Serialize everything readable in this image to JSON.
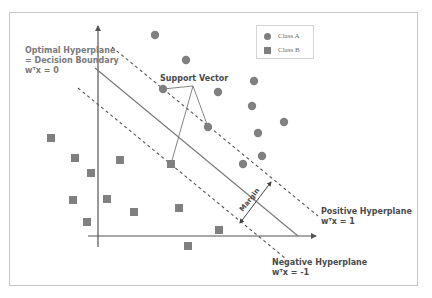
{
  "labels": {
    "optimal_hyperplane_line1": "Optimal Hyperplane",
    "optimal_hyperplane_line2": "= Decision Boundary",
    "optimal_hyperplane_eq": "wᵀx = 0",
    "support_vector": "Support Vector",
    "margin": "Margin",
    "positive_hyperplane": "Positive Hyperplane",
    "positive_hyperplane_eq": "wᵀx = 1",
    "negative_hyperplane": "Negative Hyperplane",
    "negative_hyperplane_eq": "wᵀx = -1"
  },
  "legend": {
    "items": [
      {
        "label": "Class A",
        "shape": "circle"
      },
      {
        "label": "Class B",
        "shape": "square"
      }
    ]
  },
  "colors": {
    "point_fill": "#808080",
    "axis": "#555555",
    "line": "#777777",
    "dashed": "#555555",
    "frame": "#c8c8c8",
    "label_grey": "#7a7a7a",
    "label_dark": "#4a4a4a"
  },
  "points": {
    "class_a": [
      [
        155,
        35
      ],
      [
        186,
        60
      ],
      [
        163,
        89
      ],
      [
        218,
        92
      ],
      [
        254,
        81
      ],
      [
        252,
        106
      ],
      [
        284,
        122
      ],
      [
        258,
        133
      ],
      [
        208,
        127
      ],
      [
        262,
        156
      ],
      [
        243,
        164
      ]
    ],
    "class_b": [
      [
        51,
        138
      ],
      [
        75,
        158
      ],
      [
        91,
        173
      ],
      [
        120,
        160
      ],
      [
        73,
        200
      ],
      [
        107,
        199
      ],
      [
        134,
        212
      ],
      [
        179,
        208
      ],
      [
        87,
        222
      ],
      [
        171,
        164
      ],
      [
        219,
        230
      ],
      [
        188,
        246
      ]
    ]
  },
  "support_vectors": {
    "callout_origin": [
      193,
      86
    ],
    "targets": [
      [
        163,
        89
      ],
      [
        208,
        127
      ],
      [
        171,
        164
      ]
    ]
  }
}
